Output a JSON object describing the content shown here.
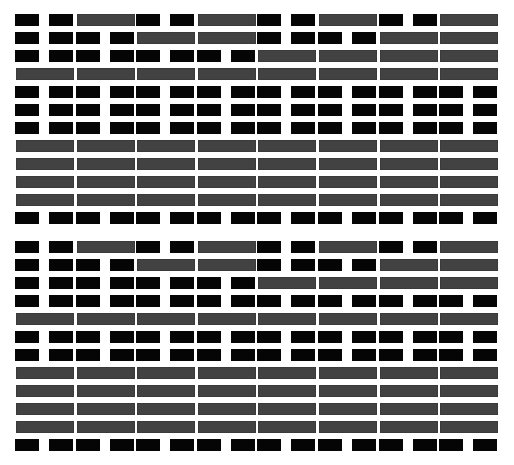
{
  "pattern": {
    "description": "Binary bit-pattern grid of black block pairs and gray bars",
    "colors": {
      "background": "#ffffff",
      "pair_block": "#050505",
      "gray_bar": "#424242"
    },
    "legend": {
      "P": "pair of black blocks",
      "G": "solid gray bar"
    },
    "columns": 8,
    "sections": [
      {
        "name": "top",
        "rows": [
          {
            "y": 14,
            "cells": [
              "P",
              "G",
              "P",
              "G",
              "P",
              "G",
              "P",
              "G"
            ]
          },
          {
            "y": 32,
            "cells": [
              "P",
              "P",
              "G",
              "G",
              "P",
              "P",
              "G",
              "G"
            ]
          },
          {
            "y": 50,
            "cells": [
              "P",
              "P",
              "P",
              "P",
              "G",
              "G",
              "G",
              "G"
            ]
          },
          {
            "y": 68,
            "cells": [
              "G",
              "G",
              "G",
              "G",
              "G",
              "G",
              "G",
              "G"
            ]
          },
          {
            "y": 86,
            "cells": [
              "P",
              "P",
              "P",
              "P",
              "P",
              "P",
              "P",
              "P"
            ]
          },
          {
            "y": 104,
            "cells": [
              "P",
              "P",
              "P",
              "P",
              "P",
              "P",
              "P",
              "P"
            ]
          },
          {
            "y": 122,
            "cells": [
              "P",
              "P",
              "P",
              "P",
              "P",
              "P",
              "P",
              "P"
            ]
          },
          {
            "y": 140,
            "cells": [
              "G",
              "G",
              "G",
              "G",
              "G",
              "G",
              "G",
              "G"
            ]
          },
          {
            "y": 158,
            "cells": [
              "G",
              "G",
              "G",
              "G",
              "G",
              "G",
              "G",
              "G"
            ]
          },
          {
            "y": 176,
            "cells": [
              "G",
              "G",
              "G",
              "G",
              "G",
              "G",
              "G",
              "G"
            ]
          },
          {
            "y": 194,
            "cells": [
              "G",
              "G",
              "G",
              "G",
              "G",
              "G",
              "G",
              "G"
            ]
          },
          {
            "y": 212,
            "cells": [
              "P",
              "P",
              "P",
              "P",
              "P",
              "P",
              "P",
              "P"
            ]
          }
        ]
      },
      {
        "name": "bottom",
        "rows": [
          {
            "y": 241,
            "cells": [
              "P",
              "G",
              "P",
              "G",
              "P",
              "G",
              "P",
              "G"
            ]
          },
          {
            "y": 259,
            "cells": [
              "P",
              "P",
              "G",
              "G",
              "P",
              "P",
              "G",
              "G"
            ]
          },
          {
            "y": 277,
            "cells": [
              "P",
              "P",
              "P",
              "P",
              "G",
              "G",
              "G",
              "G"
            ]
          },
          {
            "y": 295,
            "cells": [
              "P",
              "P",
              "P",
              "P",
              "P",
              "P",
              "P",
              "P"
            ]
          },
          {
            "y": 313,
            "cells": [
              "G",
              "G",
              "G",
              "G",
              "G",
              "G",
              "G",
              "G"
            ]
          },
          {
            "y": 331,
            "cells": [
              "P",
              "P",
              "P",
              "P",
              "P",
              "P",
              "P",
              "P"
            ]
          },
          {
            "y": 349,
            "cells": [
              "P",
              "P",
              "P",
              "P",
              "P",
              "P",
              "P",
              "P"
            ]
          },
          {
            "y": 367,
            "cells": [
              "G",
              "G",
              "G",
              "G",
              "G",
              "G",
              "G",
              "G"
            ]
          },
          {
            "y": 385,
            "cells": [
              "G",
              "G",
              "G",
              "G",
              "G",
              "G",
              "G",
              "G"
            ]
          },
          {
            "y": 403,
            "cells": [
              "G",
              "G",
              "G",
              "G",
              "G",
              "G",
              "G",
              "G"
            ]
          },
          {
            "y": 421,
            "cells": [
              "G",
              "G",
              "G",
              "G",
              "G",
              "G",
              "G",
              "G"
            ]
          },
          {
            "y": 439,
            "cells": [
              "P",
              "P",
              "P",
              "P",
              "P",
              "P",
              "P",
              "P"
            ]
          }
        ]
      }
    ]
  }
}
